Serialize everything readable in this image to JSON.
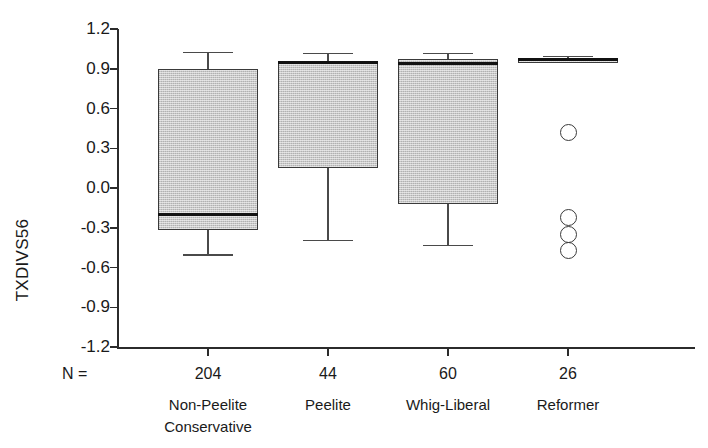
{
  "figure": {
    "top_clipped_caption": "",
    "y_axis": {
      "title": "TXDIVS56",
      "ticks": [
        "1.2",
        "0.9",
        "0.6",
        "0.3",
        "0.0",
        "-0.3",
        "-0.6",
        "-0.9",
        "-1.2"
      ],
      "tick_values": [
        1.2,
        0.9,
        0.6,
        0.3,
        0.0,
        -0.3,
        -0.6,
        -0.9,
        -1.2
      ],
      "limits": [
        -1.2,
        1.2
      ]
    },
    "n_label": "N =",
    "categories": [
      {
        "n": "204",
        "line1": "Non-Peelite",
        "line2": "Conservative"
      },
      {
        "n": "44",
        "line1": "Peelite",
        "line2": ""
      },
      {
        "n": "60",
        "line1": "Whig-Liberal",
        "line2": ""
      },
      {
        "n": "26",
        "line1": "Reformer",
        "line2": ""
      }
    ],
    "colors": {
      "box_fill": "#c8c8c8",
      "box_edge": "#3a3a3a",
      "median": "#111111",
      "axis": "#2b2b2b",
      "background": "#ffffff"
    }
  },
  "chart_data": {
    "type": "box",
    "title": "",
    "xlabel": "",
    "ylabel": "TXDIVS56",
    "ylim": [
      -1.2,
      1.2
    ],
    "grid": false,
    "legend": "none",
    "categories": [
      "Non-Peelite Conservative",
      "Peelite",
      "Whig-Liberal",
      "Reformer"
    ],
    "counts": [
      204,
      44,
      60,
      26
    ],
    "boxes": [
      {
        "category": "Non-Peelite Conservative",
        "n": 204,
        "whisker_high": 1.03,
        "q3": 0.9,
        "median": -0.2,
        "q1": -0.32,
        "whisker_low": -0.5,
        "outliers": []
      },
      {
        "category": "Peelite",
        "n": 44,
        "whisker_high": 1.02,
        "q3": 0.95,
        "median": 0.95,
        "q1": 0.15,
        "whisker_low": -0.39,
        "outliers": []
      },
      {
        "category": "Whig-Liberal",
        "n": 60,
        "whisker_high": 1.02,
        "q3": 0.97,
        "median": 0.94,
        "q1": -0.12,
        "whisker_low": -0.43,
        "outliers": []
      },
      {
        "category": "Reformer",
        "n": 26,
        "whisker_high": 1.0,
        "q3": 0.98,
        "median": 0.97,
        "q1": 0.94,
        "whisker_low": 0.94,
        "outliers": [
          0.42,
          -0.22,
          -0.35,
          -0.47
        ]
      }
    ]
  }
}
